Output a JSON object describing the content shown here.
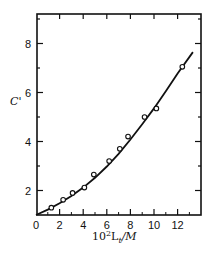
{
  "chart_data": {
    "type": "scatter",
    "title": "",
    "xlabel": "10²Lₜ/M",
    "xlabel_parts": {
      "base": "10",
      "sup": "2",
      "main": "L",
      "sub": "t",
      "tail": "/M"
    },
    "ylabel": "C'",
    "xlim": [
      0,
      14
    ],
    "ylim": [
      1,
      9
    ],
    "x_ticks": [
      0,
      2,
      4,
      6,
      8,
      10,
      12
    ],
    "y_ticks": [
      2,
      4,
      6,
      8
    ],
    "grid": false,
    "legend": null,
    "series": [
      {
        "name": "measured",
        "marker": "open-circle",
        "points": [
          {
            "x": 1.3,
            "y": 1.3
          },
          {
            "x": 2.3,
            "y": 1.62
          },
          {
            "x": 3.1,
            "y": 1.9
          },
          {
            "x": 4.1,
            "y": 2.12
          },
          {
            "x": 4.9,
            "y": 2.65
          },
          {
            "x": 6.2,
            "y": 3.2
          },
          {
            "x": 7.1,
            "y": 3.7
          },
          {
            "x": 7.8,
            "y": 4.2
          },
          {
            "x": 9.2,
            "y": 5.0
          },
          {
            "x": 10.2,
            "y": 5.35
          },
          {
            "x": 12.4,
            "y": 7.05
          }
        ]
      },
      {
        "name": "fitted-curve",
        "marker": "line",
        "points": [
          {
            "x": 0,
            "y": 1.0
          },
          {
            "x": 1,
            "y": 1.22
          },
          {
            "x": 2,
            "y": 1.48
          },
          {
            "x": 3,
            "y": 1.78
          },
          {
            "x": 4,
            "y": 2.12
          },
          {
            "x": 5,
            "y": 2.52
          },
          {
            "x": 6,
            "y": 2.98
          },
          {
            "x": 7,
            "y": 3.5
          },
          {
            "x": 8,
            "y": 4.08
          },
          {
            "x": 9,
            "y": 4.7
          },
          {
            "x": 10,
            "y": 5.35
          },
          {
            "x": 11,
            "y": 6.05
          },
          {
            "x": 12,
            "y": 6.78
          },
          {
            "x": 13.3,
            "y": 7.65
          }
        ]
      }
    ]
  }
}
